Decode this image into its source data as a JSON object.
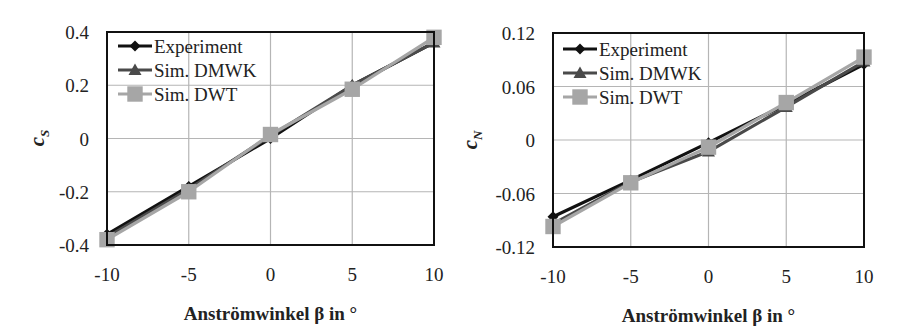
{
  "chart_data": [
    {
      "type": "line",
      "title": "",
      "xlabel": "Anströmwinkel β in °",
      "ylabel": "c_S",
      "ylabel_main": "c",
      "ylabel_sub": "S",
      "x": [
        -10,
        -5,
        0,
        5,
        10
      ],
      "xlim": [
        -10,
        10
      ],
      "ylim": [
        -0.4,
        0.4
      ],
      "xticks": [
        "-10",
        "-5",
        "0",
        "5",
        "10"
      ],
      "yticks": [
        "0.4",
        "0.2",
        "0",
        "-0.2",
        "-0.4"
      ],
      "grid": true,
      "legend_position": "upper left",
      "series": [
        {
          "name": "Experiment",
          "marker": "diamond",
          "color": "#111111",
          "values": [
            -0.36,
            -0.18,
            0.0,
            0.2,
            0.36
          ]
        },
        {
          "name": "Sim. DMWK",
          "marker": "triangle",
          "color": "#4a4a4a",
          "values": [
            -0.37,
            -0.19,
            0.01,
            0.2,
            0.36
          ]
        },
        {
          "name": "Sim. DWT",
          "marker": "square",
          "color": "#a6a6a6",
          "values": [
            -0.38,
            -0.2,
            0.015,
            0.185,
            0.38
          ]
        }
      ]
    },
    {
      "type": "line",
      "title": "",
      "xlabel": "Anströmwinkel β in °",
      "ylabel": "c_N",
      "ylabel_main": "c",
      "ylabel_sub": "N",
      "x": [
        -10,
        -5,
        0,
        5,
        10
      ],
      "xlim": [
        -10,
        10
      ],
      "ylim": [
        -0.12,
        0.12
      ],
      "xticks": [
        "-10",
        "-5",
        "0",
        "5",
        "10"
      ],
      "yticks": [
        "0.12",
        "0.06",
        "0",
        "-0.06",
        "-0.12"
      ],
      "grid": true,
      "legend_position": "upper left",
      "series": [
        {
          "name": "Experiment",
          "marker": "diamond",
          "color": "#111111",
          "values": [
            -0.086,
            -0.045,
            -0.003,
            0.04,
            0.085
          ]
        },
        {
          "name": "Sim. DMWK",
          "marker": "triangle",
          "color": "#4a4a4a",
          "values": [
            -0.094,
            -0.047,
            -0.013,
            0.037,
            0.088
          ]
        },
        {
          "name": "Sim. DWT",
          "marker": "square",
          "color": "#a6a6a6",
          "values": [
            -0.097,
            -0.048,
            -0.008,
            0.042,
            0.093
          ]
        }
      ]
    }
  ]
}
